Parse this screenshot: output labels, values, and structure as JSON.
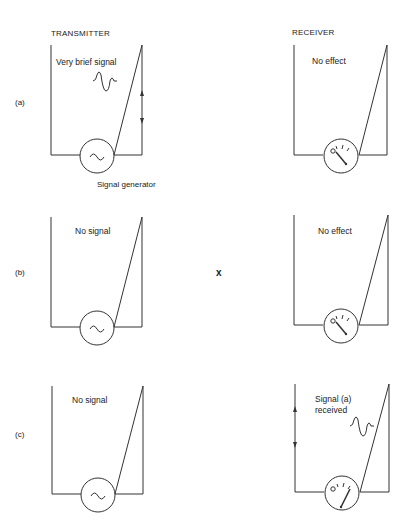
{
  "headers": {
    "transmitter": "TRANSMITTER",
    "receiver": "RECEIVER"
  },
  "rows": [
    {
      "label": "(a)",
      "transmitter_text": "Very brief signal",
      "generator_label": "Signal generator",
      "receiver_text": "No effect"
    },
    {
      "label": "(b)",
      "transmitter_text": "No signal",
      "middle_mark": "x",
      "receiver_text": "No effect"
    },
    {
      "label": "(c)",
      "transmitter_text": "No signal",
      "receiver_text_line1": "Signal (a)",
      "receiver_text_line2": "received"
    }
  ]
}
